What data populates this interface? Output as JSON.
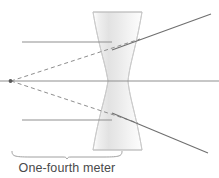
{
  "figure": {
    "type": "optics-ray-diagram",
    "width": 219,
    "height": 178,
    "background_color": "#ffffff"
  },
  "caption": {
    "label": "One-fourth meter",
    "color": "#4a4a4a"
  },
  "lens": {
    "name": "biconcave-diverging-lens",
    "fill_start_color": "#ffffff",
    "fill_mid_color": "#e9e9e9",
    "fill_end_color": "#f4f4f4",
    "stroke_color": "#b4b4b4",
    "top_y": 12,
    "bottom_y": 150,
    "top_left_x": 93,
    "top_right_x": 142,
    "waist_left_x": 108,
    "waist_right_x": 128,
    "center_y": 81
  },
  "optical_axis": {
    "name": "optical-axis",
    "y": 81,
    "x_start": 0,
    "x_end": 219,
    "color": "#8c8c8c"
  },
  "focal_point": {
    "name": "virtual-focal-point",
    "x": 10,
    "y": 81,
    "color": "#555555"
  },
  "incident_rays": [
    {
      "name": "incident-ray-upper",
      "x_start": 22,
      "y": 42,
      "x_end": 110,
      "color": "#8c8c8c"
    },
    {
      "name": "incident-ray-lower",
      "x_start": 22,
      "y": 120,
      "x_end": 110,
      "color": "#8c8c8c"
    }
  ],
  "refracted_rays": [
    {
      "name": "refracted-ray-upper",
      "x_start": 129,
      "y_start": 43,
      "x_end": 210,
      "y_end": 14,
      "color": "#6e6e6e"
    },
    {
      "name": "refracted-ray-lower",
      "x_start": 129,
      "y_start": 120,
      "x_end": 207,
      "y_end": 153,
      "color": "#6e6e6e"
    }
  ],
  "virtual_rays": [
    {
      "name": "virtual-ray-upper",
      "x_start": 11,
      "y_start": 81,
      "x_end": 138,
      "y_end": 40,
      "dash": "4 3",
      "color": "#8a8a8a"
    },
    {
      "name": "virtual-ray-lower",
      "x_start": 11,
      "y_start": 81,
      "x_end": 136,
      "y_end": 122,
      "dash": "4 3",
      "color": "#8a8a8a"
    }
  ],
  "dimension_brace": {
    "name": "one-fourth-meter-brace",
    "left_x": 12,
    "right_x": 122,
    "y": 155,
    "tick_x": 67,
    "color": "#9a9a9a"
  }
}
